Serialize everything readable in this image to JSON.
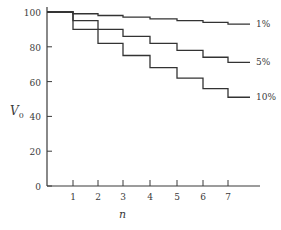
{
  "chart_data": {
    "type": "line",
    "step": true,
    "title": "",
    "xlabel": "n",
    "ylabel": "V0",
    "ylabel_main": "V",
    "ylabel_sub": "0",
    "xlim": [
      0,
      8.2
    ],
    "ylim": [
      0,
      100
    ],
    "x_ticks": [
      1,
      2,
      3,
      4,
      5,
      6,
      7
    ],
    "y_ticks": [
      0,
      20,
      40,
      60,
      80,
      100
    ],
    "grid": false,
    "legend": "inline labels at right end of each series",
    "x": [
      0,
      1,
      2,
      3,
      4,
      5,
      6,
      7,
      8
    ],
    "series": [
      {
        "name": "1%",
        "label": "1%",
        "values": [
          100,
          99,
          98,
          97,
          96,
          95,
          94,
          93,
          93
        ]
      },
      {
        "name": "5%",
        "label": "5%",
        "values": [
          100,
          95,
          90,
          86,
          82,
          78,
          74,
          71,
          71
        ]
      },
      {
        "name": "10%",
        "label": "10%",
        "values": [
          100,
          90,
          82,
          75,
          68,
          62,
          56,
          51,
          51
        ]
      }
    ]
  },
  "colors": {
    "axis": "#3a3a3a",
    "line": "#333333",
    "background": "#ffffff"
  }
}
